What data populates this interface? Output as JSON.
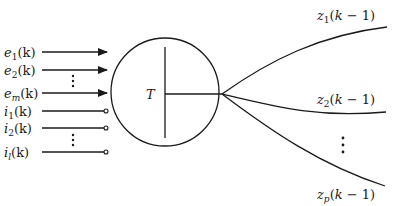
{
  "diagram": {
    "block_label": "T",
    "inputs_excitatory": [
      {
        "var": "e",
        "sub": "1",
        "arg": "(k)"
      },
      {
        "var": "e",
        "sub": "2",
        "arg": "(k)"
      },
      {
        "var": "e",
        "sub": "m",
        "arg": "(k)"
      }
    ],
    "inputs_inhibitory": [
      {
        "var": "i",
        "sub": "1",
        "arg": "(k)"
      },
      {
        "var": "i",
        "sub": "2",
        "arg": "(k)"
      },
      {
        "var": "i",
        "sub": "l",
        "arg": "(k)"
      }
    ],
    "outputs": [
      {
        "var": "z",
        "sub": "1",
        "arg_open": "(",
        "k": "k",
        "minus": " − ",
        "one": "1)"
      },
      {
        "var": "z",
        "sub": "2",
        "arg_open": "(",
        "k": "k",
        "minus": " − ",
        "one": "1)"
      },
      {
        "var": "z",
        "sub": "p",
        "arg_open": "(",
        "k": "k",
        "minus": " − ",
        "one": "1)"
      }
    ],
    "ellipsis": "⋮",
    "colors": {
      "ink": "#1a1a1a",
      "background": "#ffffff"
    }
  }
}
